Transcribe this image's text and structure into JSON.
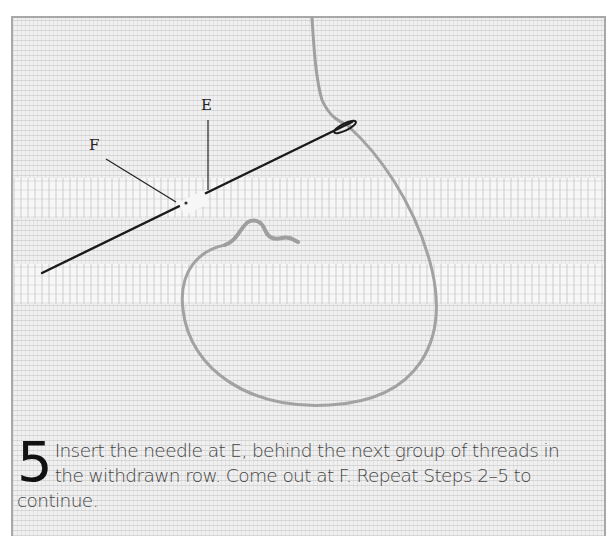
{
  "figure": {
    "labels": {
      "e": "E",
      "f": "F"
    },
    "elements": [
      "fabric-even-weave",
      "withdrawn-thread-rows",
      "needle",
      "working-thread-loop"
    ]
  },
  "caption": {
    "step_number": "5",
    "text": "Insert the needle at E, behind the next group of threads in the withdrawn row. Come out at F. Repeat Steps 2–5 to continue."
  },
  "colors": {
    "fabric": "#f0f0f0",
    "frame_border": "#a8a8a8",
    "needle": "#1a1a1a",
    "thread": "#9a9a9a",
    "text": "#444444"
  }
}
